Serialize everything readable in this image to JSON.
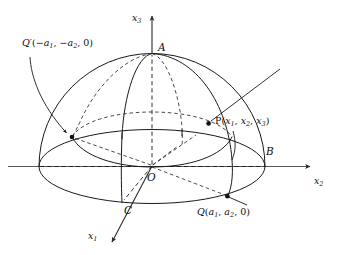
{
  "figure": {
    "background_color": "#ffffff",
    "ink_color": "#1a1a1a",
    "axis_color": "#555555"
  },
  "axes": [
    {
      "name": "x3",
      "label_plain": "x3",
      "base": "x",
      "subscript": "3",
      "direction": "up",
      "arrow": true
    },
    {
      "name": "x2",
      "label_plain": "x2",
      "base": "x",
      "subscript": "2",
      "direction": "right",
      "arrow": true
    },
    {
      "name": "x1",
      "label_plain": "x1",
      "base": "x",
      "subscript": "1",
      "direction": "lower-left",
      "arrow": true
    }
  ],
  "points": [
    {
      "name": "A",
      "label": "A",
      "position_px": [
        152,
        53
      ],
      "description": "north pole of hemisphere on x3 axis"
    },
    {
      "name": "B",
      "label": "B",
      "position_px": [
        264,
        158
      ],
      "description": "point on rim on x2 axis"
    },
    {
      "name": "C",
      "label": "C",
      "position_px": [
        122,
        203
      ],
      "description": "point on rim on x1 axis"
    },
    {
      "name": "O",
      "label": "O",
      "position_px": [
        152,
        166
      ],
      "description": "origin / center of hemisphere"
    },
    {
      "name": "P",
      "label": "P",
      "coords": "(x1, x2, x3)",
      "position_px": [
        208,
        123
      ],
      "description": "point on spherical surface"
    },
    {
      "name": "Q",
      "label": "Q",
      "coords": "(a1, a2, 0)",
      "position_px": [
        227,
        196
      ],
      "description": "point on equatorial rim, front right"
    },
    {
      "name": "Qprime",
      "label": "Q'",
      "coords": "(-a1, -a2, 0)",
      "position_px": [
        72,
        137
      ],
      "description": "antipodal rim point, back left"
    }
  ],
  "labels": {
    "x3": {
      "base": "x",
      "sub": "3"
    },
    "x2": {
      "base": "x",
      "sub": "2"
    },
    "x1": {
      "base": "x",
      "sub": "1"
    },
    "A": "A",
    "B": "B",
    "C": "C",
    "O": "O",
    "P": {
      "name": "P",
      "open": "(",
      "x1": "x",
      "s1": "1",
      "c1": ", ",
      "x2": "x",
      "s2": "2",
      "c2": ", ",
      "x3": "x",
      "s3": "3",
      "close": ")"
    },
    "Q": {
      "name": "Q",
      "open": "(",
      "a1": "a",
      "s1": "1",
      "c1": ", ",
      "a2": "a",
      "s2": "2",
      "c2": ", ",
      "zero": "0",
      "close": ")"
    },
    "Qprime": {
      "name": "Q",
      "prime": "′",
      "open": "(",
      "m1": "−",
      "a1": "a",
      "s1": "1",
      "c1": ", ",
      "m2": "−",
      "a2": "a",
      "s2": "2",
      "c2": ", ",
      "zero": "0",
      "close": ")"
    }
  },
  "geometry": {
    "origin_px": [
      152,
      166
    ],
    "equator_ellipse": {
      "cx": 152,
      "cy": 166,
      "rx": 113,
      "ry": 37
    },
    "sphere_radius_px": 113,
    "meridians": 4,
    "dashed_radii_from_origin": [
      "to Q'",
      "to Q",
      "to rim left along x2",
      "to A along x3"
    ],
    "leader_lines": [
      {
        "from": "Q' label",
        "to": "Q' point",
        "arrow": true
      },
      {
        "from": "upper-right free end",
        "to": "P point",
        "arrow": false
      },
      {
        "from": "P label",
        "to": "front meridian",
        "arrow": false
      },
      {
        "from": "Q point",
        "to": "Q label",
        "arrow": false
      }
    ]
  }
}
